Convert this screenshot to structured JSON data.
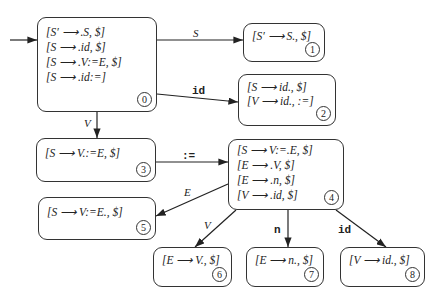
{
  "states": [
    {
      "id": "0",
      "items": [
        "[S′ ⟶ .S, $]",
        "[S ⟶ .id, $]",
        "[S ⟶ .V:=E, $]",
        "[S ⟶ .id:=]"
      ]
    },
    {
      "id": "1",
      "items": [
        "[S′ ⟶ S., $]"
      ]
    },
    {
      "id": "2",
      "items": [
        "[S ⟶ id., $]",
        "[V ⟶ id., :=]"
      ]
    },
    {
      "id": "3",
      "items": [
        "[S ⟶ V.:=E, $]"
      ]
    },
    {
      "id": "4",
      "items": [
        "[S ⟶ V:=.E, $]",
        "[E ⟶ .V, $]",
        "[E ⟶ .n, $]",
        "[V ⟶ .id, $]"
      ]
    },
    {
      "id": "5",
      "items": [
        "[S ⟶ V:=E., $]"
      ]
    },
    {
      "id": "6",
      "items": [
        "[E ⟶ V., $]"
      ]
    },
    {
      "id": "7",
      "items": [
        "[E ⟶ n., $]"
      ]
    },
    {
      "id": "8",
      "items": [
        "[V ⟶ id., $]"
      ]
    }
  ],
  "transitions": [
    {
      "from": "0",
      "to": "1",
      "label": "S"
    },
    {
      "from": "0",
      "to": "2",
      "label": "id"
    },
    {
      "from": "0",
      "to": "3",
      "label": "V"
    },
    {
      "from": "3",
      "to": "4",
      "label": ":="
    },
    {
      "from": "4",
      "to": "5",
      "label": "E"
    },
    {
      "from": "4",
      "to": "6",
      "label": "V"
    },
    {
      "from": "4",
      "to": "7",
      "label": "n"
    },
    {
      "from": "4",
      "to": "8",
      "label": "id"
    }
  ]
}
